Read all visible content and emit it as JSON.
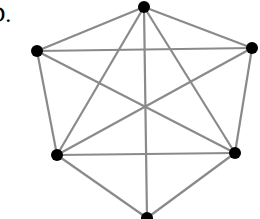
{
  "label": "D.",
  "graph": {
    "edge_color": "#8a8a8a",
    "vertex_color": "#000000",
    "vertices": [
      {
        "id": "top",
        "x": 144,
        "y": 7
      },
      {
        "id": "upper-left",
        "x": 37,
        "y": 51
      },
      {
        "id": "upper-right",
        "x": 252,
        "y": 48
      },
      {
        "id": "lower-left",
        "x": 57,
        "y": 155
      },
      {
        "id": "lower-right",
        "x": 235,
        "y": 153
      },
      {
        "id": "bottom",
        "x": 147,
        "y": 218
      }
    ],
    "edges": [
      [
        "top",
        "upper-left"
      ],
      [
        "top",
        "upper-right"
      ],
      [
        "top",
        "lower-left"
      ],
      [
        "top",
        "lower-right"
      ],
      [
        "top",
        "bottom"
      ],
      [
        "upper-left",
        "upper-right"
      ],
      [
        "upper-left",
        "lower-left"
      ],
      [
        "upper-left",
        "lower-right"
      ],
      [
        "upper-right",
        "lower-right"
      ],
      [
        "upper-right",
        "lower-left"
      ],
      [
        "lower-left",
        "lower-right"
      ],
      [
        "lower-left",
        "bottom"
      ],
      [
        "lower-right",
        "bottom"
      ]
    ]
  }
}
